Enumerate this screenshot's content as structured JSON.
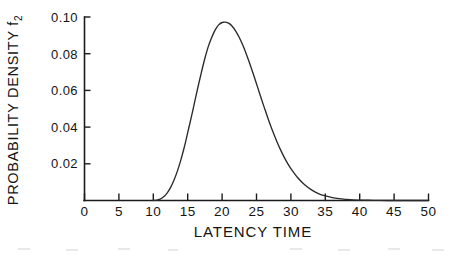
{
  "figure": {
    "background_color": "#ffffff",
    "ink_color": "#1b1b1b",
    "curve_color": "#2a2a2a"
  },
  "chart_data": {
    "type": "line",
    "title": "",
    "xlabel": "LATENCY TIME",
    "ylabel": "PROBABILITY DENSITY f",
    "ylabel_subscript": "2",
    "xlim": [
      0,
      50
    ],
    "ylim": [
      0,
      0.1
    ],
    "grid": false,
    "legend": null,
    "x_ticks": [
      0,
      5,
      10,
      15,
      20,
      25,
      30,
      35,
      40,
      45,
      50
    ],
    "x_tick_labels": [
      "0",
      "5",
      "10",
      "15",
      "20",
      "25",
      "30",
      "35",
      "40",
      "45",
      "50"
    ],
    "y_ticks": [
      0.02,
      0.04,
      0.06,
      0.08,
      0.1
    ],
    "y_tick_labels": [
      "0.02",
      "0.04",
      "0.06",
      "0.08",
      "0.10"
    ],
    "annotations": [],
    "peak": {
      "x": 21.0,
      "y": 0.097
    },
    "series": [
      {
        "name": "f2 latency time density",
        "x": [
          10.0,
          10.5,
          11.0,
          11.5,
          12.0,
          12.5,
          13.0,
          13.5,
          14.0,
          14.5,
          15.0,
          15.5,
          16.0,
          16.5,
          17.0,
          17.5,
          18.0,
          18.5,
          19.0,
          19.5,
          20.0,
          20.5,
          21.0,
          21.5,
          22.0,
          22.5,
          23.0,
          23.5,
          24.0,
          24.5,
          25.0,
          25.5,
          26.0,
          26.5,
          27.0,
          27.5,
          28.0,
          28.5,
          29.0,
          29.5,
          30.0,
          31.0,
          32.0,
          33.0,
          34.0,
          35.0,
          36.0,
          37.0,
          38.0,
          39.0,
          40.0,
          42.0,
          44.0,
          46.0,
          48.0,
          50.0
        ],
        "y": [
          0.0,
          0.0002,
          0.0008,
          0.002,
          0.004,
          0.007,
          0.011,
          0.016,
          0.022,
          0.029,
          0.037,
          0.045,
          0.0535,
          0.062,
          0.07,
          0.0775,
          0.084,
          0.089,
          0.093,
          0.0957,
          0.097,
          0.0972,
          0.0965,
          0.0948,
          0.0922,
          0.0888,
          0.0847,
          0.08,
          0.0748,
          0.0693,
          0.0636,
          0.0578,
          0.0521,
          0.0466,
          0.0413,
          0.0364,
          0.0318,
          0.0276,
          0.0238,
          0.0204,
          0.0174,
          0.0124,
          0.0086,
          0.0058,
          0.0038,
          0.0025,
          0.0016,
          0.001,
          0.0006,
          0.0003,
          0.0002,
          0.0001,
          0.0,
          0.0,
          0.0,
          0.0
        ]
      }
    ]
  }
}
